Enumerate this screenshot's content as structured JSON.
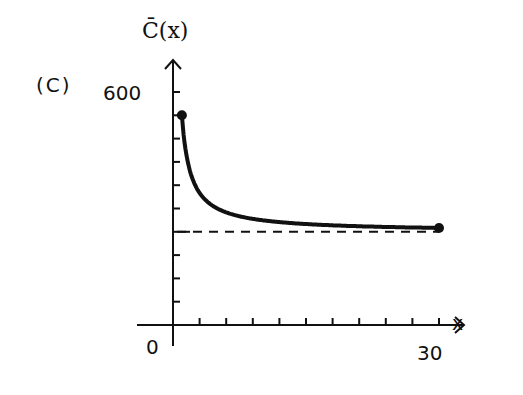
{
  "panel_label": "(C)",
  "chart_data": {
    "type": "line",
    "title": "",
    "xlabel": "x",
    "ylabel": "C̄(x)",
    "x_tick_labels": [
      "0",
      "30"
    ],
    "y_tick_labels": [
      "600"
    ],
    "xlim": [
      0,
      30
    ],
    "ylim": [
      0,
      600
    ],
    "x_tick_step": 3,
    "y_tick_step": 60,
    "grid": false,
    "legend": null,
    "series": [
      {
        "name": "C̄(x)",
        "style": "solid",
        "x": [
          1,
          2,
          3,
          4,
          5,
          6,
          8,
          10,
          12,
          15,
          20,
          25,
          30
        ],
        "y": [
          540,
          390,
          340,
          315,
          300,
          290,
          277.5,
          270,
          265,
          260,
          255,
          252,
          250
        ],
        "endpoints": [
          {
            "x": 1,
            "y": 540
          },
          {
            "x": 30,
            "y": 250
          }
        ]
      },
      {
        "name": "asymptote",
        "style": "dashed",
        "x": [
          0,
          30
        ],
        "y": [
          240,
          240
        ]
      }
    ]
  }
}
